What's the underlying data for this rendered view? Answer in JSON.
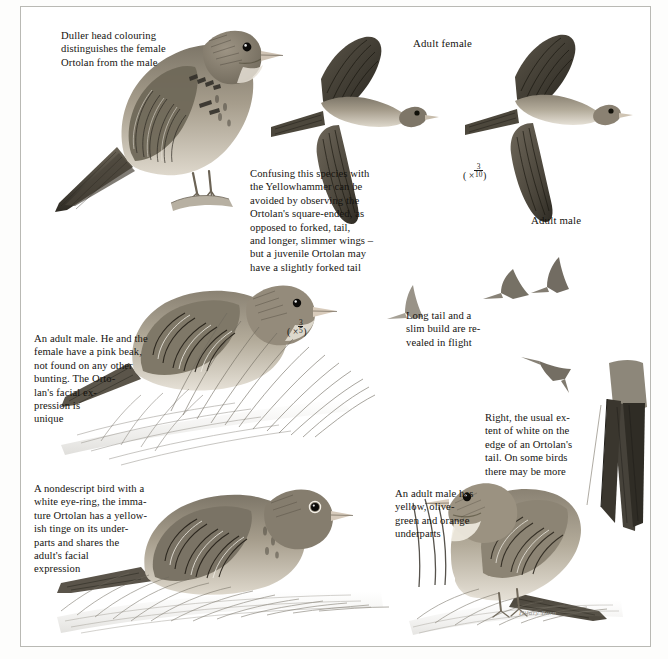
{
  "plate": {
    "title": "Ortolan Bunting field-guide plate",
    "background_color": "#ffffff",
    "frame_color": "#b9b9b4",
    "ink_color": "#15130f",
    "signature": "Hilary Burn"
  },
  "captions": [
    {
      "id": "female-head",
      "name": "caption-female-head-colouring",
      "text": "Duller head colouring\ndistinguishes the female\nOrtolan from the male"
    },
    {
      "id": "yellowhammer-confusion",
      "name": "caption-yellowhammer-confusion",
      "text": "Confusing this species with\nthe Yellowhammer can be\navoided by observing the\nOrtolan's square-ended, as\nopposed to forked, tail,\nand longer, slimmer wings –\nbut a juvenile Ortolan may\nhave a slightly forked tail"
    },
    {
      "id": "adult-male-pink-beak",
      "name": "caption-adult-male-pink-beak",
      "text": "An adult male. He and the\nfemale have a pink beak,\nnot found on any other\nbunting. The Orto-\nlan's facial ex-\npression is\nunique"
    },
    {
      "id": "flight-silhouettes",
      "name": "caption-long-tail-slim-build",
      "text": "Long tail and a\nslim build are re-\nvealed in flight"
    },
    {
      "id": "tail-white",
      "name": "caption-tail-white-extent",
      "text": "Right, the usual ex-\ntent of white on the\nedge of an Ortolan's\ntail. On some birds\nthere may be more"
    },
    {
      "id": "immature",
      "name": "caption-immature-nondescript",
      "text": "A nondescript bird with a\nwhite eye-ring, the imma-\nture Ortolan has a yellow-\nish tinge on its under-\nparts and shares the\nadult's facial\nexpression"
    },
    {
      "id": "adult-male-underparts",
      "name": "caption-adult-male-underparts",
      "text": "An adult male has\nyellow, olive-\ngreen and orange\nunderparts"
    }
  ],
  "labels": [
    {
      "id": "adult-female",
      "name": "label-adult-female",
      "text": "Adult female"
    },
    {
      "id": "adult-male",
      "name": "label-adult-male",
      "text": "Adult male"
    }
  ],
  "scales": [
    {
      "id": "flight-scale",
      "name": "scale-flight-birds",
      "prefix": "( ×",
      "numerator": "3",
      "denominator": "10",
      "suffix": ")"
    },
    {
      "id": "perched-scale",
      "name": "scale-perched-bird",
      "prefix": "( ×",
      "numerator": "3",
      "denominator": "5",
      "suffix": ")"
    }
  ],
  "figures": [
    {
      "id": "female-perched",
      "name": "figure-female-perched-bunting",
      "subject": "Adult female Ortolan perched on branch"
    },
    {
      "id": "female-flight",
      "name": "figure-adult-female-in-flight",
      "subject": "Adult female Ortolan in flight, upperside"
    },
    {
      "id": "male-flight",
      "name": "figure-adult-male-in-flight",
      "subject": "Adult male Ortolan in flight, upperside"
    },
    {
      "id": "male-grass",
      "name": "figure-adult-male-in-grass",
      "subject": "Adult male Ortolan among grass stems"
    },
    {
      "id": "immature-ground",
      "name": "figure-immature-on-ground",
      "subject": "Immature Ortolan on the ground"
    },
    {
      "id": "male-ground",
      "name": "figure-adult-male-on-ground",
      "subject": "Adult male Ortolan standing on the ground"
    },
    {
      "id": "tail-detail",
      "name": "figure-tail-white-detail",
      "subject": "Spread tail showing white outer feather edges"
    },
    {
      "id": "silhouette-1",
      "name": "figure-flight-silhouette-left",
      "subject": "Small flight silhouette, left"
    },
    {
      "id": "silhouette-2",
      "name": "figure-flight-silhouette-middle",
      "subject": "Small flight silhouette, middle"
    },
    {
      "id": "silhouette-3",
      "name": "figure-flight-silhouette-upper",
      "subject": "Small flight silhouette, upper right"
    },
    {
      "id": "silhouette-4",
      "name": "figure-flight-silhouette-lower",
      "subject": "Small flight silhouette, lower right"
    }
  ]
}
